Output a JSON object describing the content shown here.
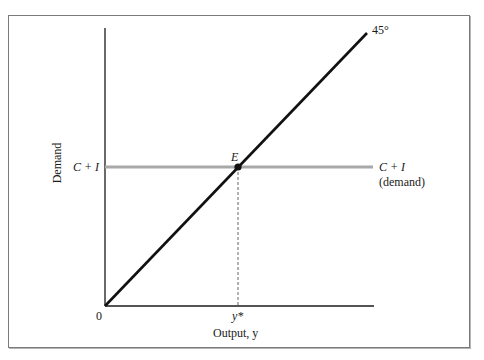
{
  "figure": {
    "type": "Keynesian cross diagram",
    "y_axis_label": "Demand",
    "x_axis_label": "Output, y",
    "origin_label": "0",
    "diagonal_label": "45°",
    "horizontal_line_left_label": "C + I",
    "horizontal_line_right_label": "C + I",
    "horizontal_line_right_sublabel": "(demand)",
    "equilibrium_label": "E",
    "equilibrium_output_label": "y*"
  },
  "colors": {
    "axis": "#1a1a1a",
    "diagonal": "#111111",
    "demand_line": "#a8a8a8",
    "equilibrium_point": "#111111",
    "dashed_line": "#555555",
    "frame": "#7a7a7a"
  },
  "geometry": {
    "origin": [
      105,
      306
    ],
    "y_axis_top": [
      105,
      28
    ],
    "x_axis_end": [
      374,
      306
    ],
    "diagonal_end": [
      367,
      33
    ],
    "demand_line_y": 167,
    "demand_line_x_range": [
      105,
      373
    ],
    "equilibrium": [
      238,
      167
    ]
  }
}
